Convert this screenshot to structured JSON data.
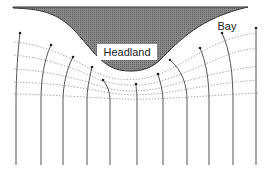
{
  "diagram": {
    "type": "wave refraction at headland and bay",
    "labels": {
      "headland": "Headland",
      "bay": "Bay"
    },
    "colors": {
      "land_fill": "#7a7a7a",
      "land_stroke": "#333333",
      "orthogonal_line": "#555555",
      "crest_line": "#999999",
      "label_bg": "#ffffff"
    },
    "wave_orthogonals_count": 11,
    "wave_crests_count": 5
  }
}
